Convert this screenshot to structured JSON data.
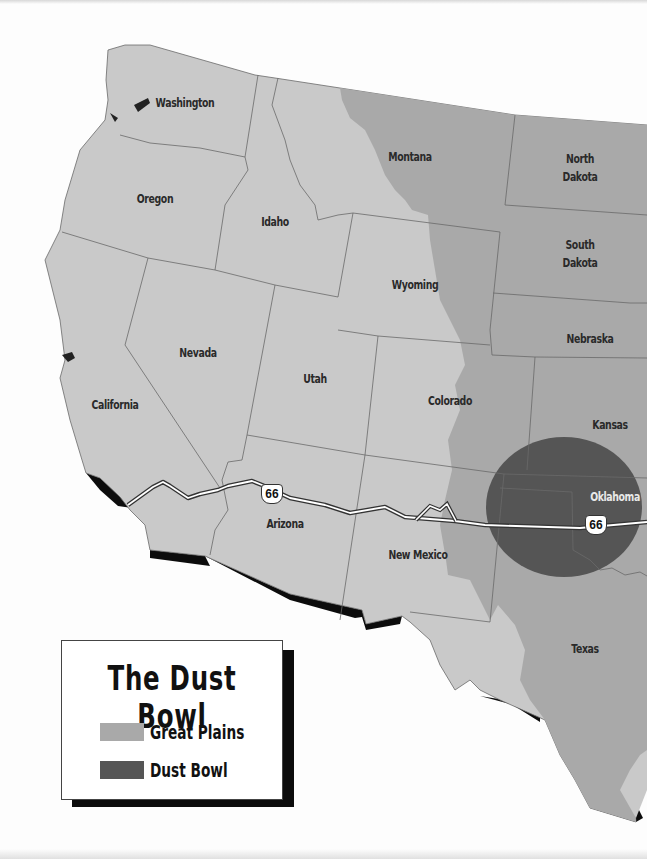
{
  "map": {
    "title": "The Dust Bowl",
    "colors": {
      "background": "#fdfdfd",
      "land": "#c9c9c9",
      "great_plains": "#a9a9a9",
      "dust_bowl": "#555555",
      "borders": "#6a6a6a",
      "shadow": "#0c0c0c"
    },
    "states": [
      {
        "name": "Washington",
        "label": "Washington"
      },
      {
        "name": "Oregon",
        "label": "Oregon"
      },
      {
        "name": "Idaho",
        "label": "Idaho"
      },
      {
        "name": "Montana",
        "label": "Montana"
      },
      {
        "name": "North Dakota",
        "label": "North\nDakota",
        "line1": "North",
        "line2": "Dakota"
      },
      {
        "name": "South Dakota",
        "label": "South\nDakota",
        "line1": "South",
        "line2": "Dakota"
      },
      {
        "name": "Wyoming",
        "label": "Wyoming"
      },
      {
        "name": "Nebraska",
        "label": "Nebraska"
      },
      {
        "name": "Nevada",
        "label": "Nevada"
      },
      {
        "name": "Utah",
        "label": "Utah"
      },
      {
        "name": "Colorado",
        "label": "Colorado"
      },
      {
        "name": "Kansas",
        "label": "Kansas"
      },
      {
        "name": "California",
        "label": "California"
      },
      {
        "name": "Arizona",
        "label": "Arizona"
      },
      {
        "name": "New Mexico",
        "label": "New Mexico"
      },
      {
        "name": "Oklahoma",
        "label": "Oklahoma"
      },
      {
        "name": "Texas",
        "label": "Texas"
      }
    ],
    "routes": [
      {
        "name": "Route 66",
        "shield": "66",
        "shield_count": 2
      }
    ]
  },
  "legend": {
    "title": "The Dust Bowl",
    "items": [
      {
        "label": "Great Plains",
        "color": "#a9a9a9"
      },
      {
        "label": "Dust Bowl",
        "color": "#555555"
      }
    ]
  }
}
